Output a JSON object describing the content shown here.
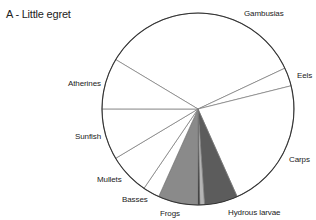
{
  "chart_data": {
    "type": "pie",
    "title": "A - Little egret",
    "start_angle_deg": 301,
    "direction": "clockwise",
    "center": [
      198,
      109
    ],
    "radius": 96,
    "slices": [
      {
        "name": "Gambusias",
        "value": 34.4,
        "color": "#ffffff"
      },
      {
        "name": "Eels",
        "value": 3.1,
        "color": "#ffffff"
      },
      {
        "name": "Carps",
        "value": 22.2,
        "color": "#ffffff"
      },
      {
        "name": "Hydrous larvae",
        "value": 5.6,
        "color": "#5c5c5c"
      },
      {
        "name": "",
        "value": 0.8,
        "color": "#b4b4b4"
      },
      {
        "name": "",
        "value": 0.3,
        "color": "#111111"
      },
      {
        "name": "Frogs",
        "value": 6.7,
        "color": "#8a8a8a"
      },
      {
        "name": "Basses",
        "value": 2.8,
        "color": "#ffffff"
      },
      {
        "name": "Mullets",
        "value": 6.9,
        "color": "#ffffff"
      },
      {
        "name": "Sunfish",
        "value": 8.6,
        "color": "#ffffff"
      },
      {
        "name": "Atherines",
        "value": 8.6,
        "color": "#ffffff"
      }
    ],
    "labels": [
      {
        "text": "Gambusias",
        "x": 244,
        "y": 9
      },
      {
        "text": "Eels",
        "x": 297,
        "y": 71
      },
      {
        "text": "Carps",
        "x": 289,
        "y": 155
      },
      {
        "text": "Hydrous larvae",
        "x": 228,
        "y": 208
      },
      {
        "text": "Frogs",
        "x": 160,
        "y": 209
      },
      {
        "text": "Basses",
        "x": 122,
        "y": 195
      },
      {
        "text": "Mullets",
        "x": 97,
        "y": 175
      },
      {
        "text": "Sunfish",
        "x": 75,
        "y": 132
      },
      {
        "text": "Atherines",
        "x": 68,
        "y": 79
      }
    ],
    "legend": "none (labels placed outside slices)"
  }
}
